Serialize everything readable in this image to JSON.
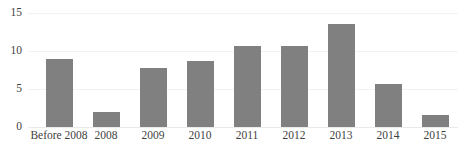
{
  "chart_data": {
    "type": "bar",
    "title": "",
    "subtitle": "",
    "xlabel": "",
    "ylabel": "",
    "categories": [
      "Before 2008",
      "2008",
      "2009",
      "2010",
      "2011",
      "2012",
      "2013",
      "2014",
      "2015"
    ],
    "values": [
      8.9,
      2.0,
      7.8,
      8.7,
      10.7,
      10.7,
      13.6,
      5.6,
      1.6
    ],
    "ylim": [
      0,
      15
    ],
    "ytick_labels": [
      "0",
      "5",
      "10",
      "15"
    ],
    "ytick_values": [
      0,
      5,
      10,
      15
    ],
    "grid": true,
    "grid_axis": "y",
    "legend": false,
    "legend_position": "none",
    "series": [
      {
        "name": "",
        "values": [
          8.9,
          2.0,
          7.8,
          8.7,
          10.7,
          10.7,
          13.6,
          5.6,
          1.6
        ]
      }
    ],
    "colors": {
      "bar": "#808080",
      "gridline": "#f2f2f2",
      "baseline": "#eaeaea",
      "text": "#3f3f3f",
      "background": "#ffffff"
    }
  }
}
